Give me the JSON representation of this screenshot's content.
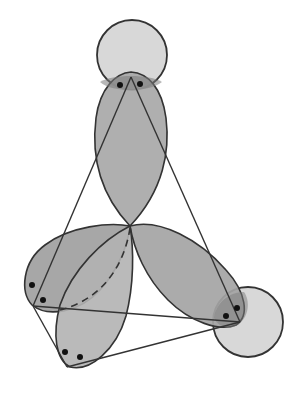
{
  "diagram": {
    "colors": {
      "background": "#ffffff",
      "lobe_fill": "#a6a6a6",
      "atom_fill": "#d6d6d6",
      "overlap_fill": "#8a8a8a",
      "stroke": "#333333",
      "dot": "#111111"
    },
    "center": {
      "x": 130,
      "y": 225
    },
    "atoms": [
      {
        "name": "top-atom",
        "cx": 132,
        "cy": 55,
        "r": 35
      },
      {
        "name": "right-atom",
        "cx": 248,
        "cy": 322,
        "r": 35
      }
    ],
    "lobes": [
      {
        "name": "top-lobe",
        "tip_x": 130,
        "tip_y": 72,
        "length": 153,
        "width": 72
      },
      {
        "name": "left-lobe",
        "tip_x": 22,
        "tip_y": 298,
        "width": 80
      },
      {
        "name": "bottom-lobe",
        "tip_x": 66,
        "tip_y": 370,
        "width": 78
      },
      {
        "name": "right-lobe",
        "tip_x": 250,
        "tip_y": 315,
        "width": 78
      }
    ],
    "vertices": {
      "top": {
        "x": 131,
        "y": 77
      },
      "left": {
        "x": 33,
        "y": 306
      },
      "bottom": {
        "x": 67,
        "y": 367
      },
      "right": {
        "x": 240,
        "y": 322
      }
    },
    "electron_dots": [
      {
        "x": 120,
        "y": 85
      },
      {
        "x": 140,
        "y": 84
      },
      {
        "x": 32,
        "y": 285
      },
      {
        "x": 43,
        "y": 300
      },
      {
        "x": 65,
        "y": 352
      },
      {
        "x": 80,
        "y": 357
      },
      {
        "x": 226,
        "y": 316
      },
      {
        "x": 237,
        "y": 308
      }
    ]
  }
}
